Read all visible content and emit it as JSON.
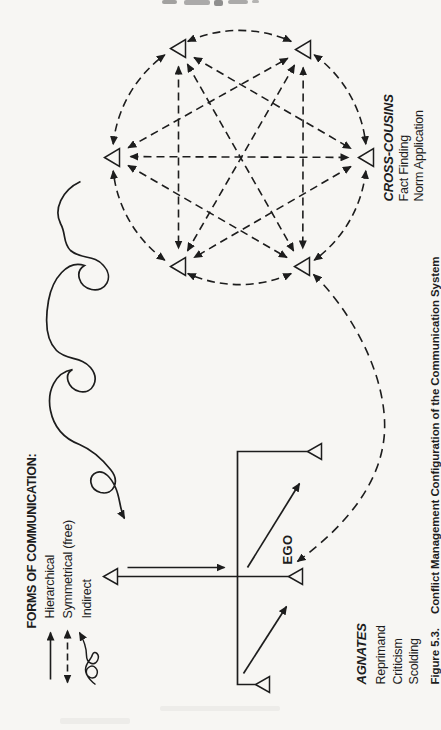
{
  "page": {
    "type": "scanned-book-figure",
    "colors": {
      "ink": "#1d1d1d",
      "paper": "#f7f6f3"
    }
  },
  "figure": {
    "caption_label": "Figure 5.3.",
    "caption_title": "Conflict Management Configuration of the Communication System"
  },
  "legend": {
    "heading": "FORMS OF COMMUNICATION:",
    "items": [
      {
        "label": "Hierarchical",
        "symbol": "solid-single-arrow"
      },
      {
        "label": "Symmetrical (free)",
        "symbol": "dashed-double-arrow"
      },
      {
        "label": "Indirect",
        "symbol": "looping-curve-arrow"
      }
    ]
  },
  "nodes": {
    "ego_label": "EGO",
    "cross_cousins": {
      "title": "CROSS-COUSINS",
      "functions": [
        "Fact Finding",
        "Norm Application"
      ],
      "member_count": 6,
      "link_style": "dashed symmetrical arrows, fully interconnected circle"
    },
    "agnates": {
      "title": "AGNATES",
      "functions": [
        "Reprimand",
        "Criticism",
        "Scolding"
      ],
      "link_style": "solid hierarchical arrows on kinship chart"
    }
  }
}
